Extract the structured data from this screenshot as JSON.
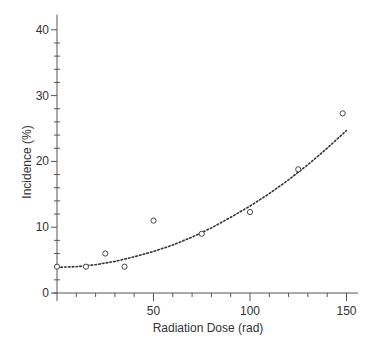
{
  "chart_data": {
    "type": "scatter",
    "title": "",
    "xlabel": "Radiation Dose (rad)",
    "ylabel": "Incidence (%)",
    "xlim": [
      0,
      156
    ],
    "ylim": [
      0,
      42
    ],
    "xticks": [
      50,
      100,
      150
    ],
    "yticks": [
      0,
      10,
      20,
      30,
      40
    ],
    "grid": false,
    "legend": null,
    "series": [
      {
        "name": "Observed",
        "type": "scatter",
        "marker": "open-circle",
        "x": [
          0,
          15,
          25,
          35,
          50,
          75,
          100,
          125,
          148
        ],
        "y": [
          4,
          4,
          6,
          4,
          11,
          9,
          12.3,
          18.8,
          27.3
        ]
      },
      {
        "name": "Fitted curve",
        "type": "line",
        "style": "dotted",
        "x": [
          0,
          10,
          20,
          30,
          40,
          50,
          60,
          70,
          80,
          90,
          100,
          110,
          120,
          130,
          140,
          150
        ],
        "y": [
          3.9,
          4.0,
          4.3,
          4.8,
          5.5,
          6.3,
          7.3,
          8.5,
          9.9,
          11.5,
          13.2,
          15.1,
          17.2,
          19.5,
          22.0,
          24.7
        ]
      }
    ]
  },
  "labels": {
    "x_axis": "Radiation Dose (rad)",
    "y_axis": "Incidence (%)",
    "x_ticks": [
      "50",
      "100",
      "150"
    ],
    "y_ticks": [
      "0",
      "10",
      "20",
      "30",
      "40"
    ]
  },
  "colors": {
    "axis": "#555555",
    "curve": "#333333",
    "marker": "#444444",
    "text": "#333333"
  }
}
